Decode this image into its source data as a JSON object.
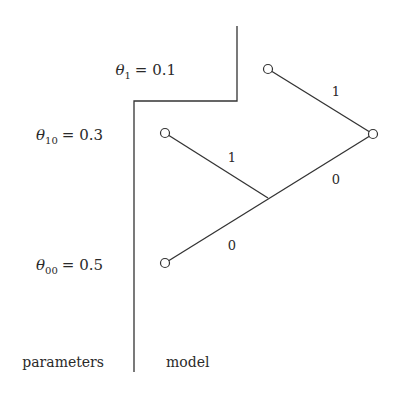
{
  "diagram": {
    "parameters": [
      {
        "symbol": "θ",
        "subscript": "1",
        "equals": "= 0.1",
        "x": 176,
        "y": 75
      },
      {
        "symbol": "θ",
        "subscript": "10",
        "equals": "= 0.3",
        "x": 103,
        "y": 140
      },
      {
        "symbol": "θ",
        "subscript": "00",
        "equals": "= 0.5",
        "x": 103,
        "y": 270
      }
    ],
    "edge_labels": [
      {
        "text": "1",
        "x": 336,
        "y": 96
      },
      {
        "text": "1",
        "x": 232,
        "y": 162
      },
      {
        "text": "0",
        "x": 336,
        "y": 184
      },
      {
        "text": "0",
        "x": 232,
        "y": 250
      }
    ],
    "captions": {
      "left": "parameters",
      "right": "model"
    },
    "nodes": [
      {
        "id": "theta1",
        "cx": 268,
        "cy": 69
      },
      {
        "id": "root",
        "cx": 373,
        "cy": 134
      },
      {
        "id": "theta10",
        "cx": 165,
        "cy": 133
      },
      {
        "id": "theta00",
        "cx": 165,
        "cy": 263
      }
    ],
    "junction": {
      "x": 268,
      "y": 198
    },
    "divider": {
      "top_x": 237,
      "top_y": 26,
      "step_y": 101,
      "bottom_x": 134,
      "bottom_y": 372
    },
    "colors": {
      "ink": "#333333",
      "background": "#ffffff"
    }
  }
}
